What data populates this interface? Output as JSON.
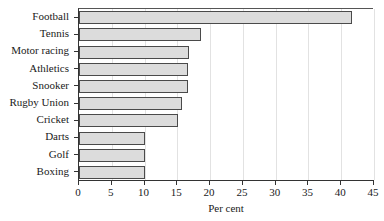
{
  "chart_data": {
    "type": "bar",
    "orientation": "horizontal",
    "title": "",
    "xlabel": "Per cent",
    "ylabel": "",
    "xlim": [
      0,
      45
    ],
    "xticks": [
      0,
      5,
      10,
      15,
      20,
      25,
      30,
      35,
      40,
      45
    ],
    "xtick_labels": [
      "0",
      "5",
      "10",
      "15",
      "20",
      "25",
      "30",
      "35",
      "40",
      "45"
    ],
    "grid": "vertical",
    "legend": null,
    "categories": [
      "Football",
      "Tennis",
      "Motor racing",
      "Athletics",
      "Snooker",
      "Rugby Union",
      "Cricket",
      "Darts",
      "Golf",
      "Boxing"
    ],
    "values": [
      41.6,
      18.6,
      16.8,
      16.6,
      16.7,
      15.7,
      15.1,
      10.0,
      10.0,
      10.0
    ],
    "colors": {
      "bar_fill": "#dcdcdc",
      "bar_edge": "#4a4a4a",
      "axis": "#333333",
      "grid": "#e2e2e2",
      "text": "#1a1a1a",
      "background": "#ffffff"
    }
  }
}
